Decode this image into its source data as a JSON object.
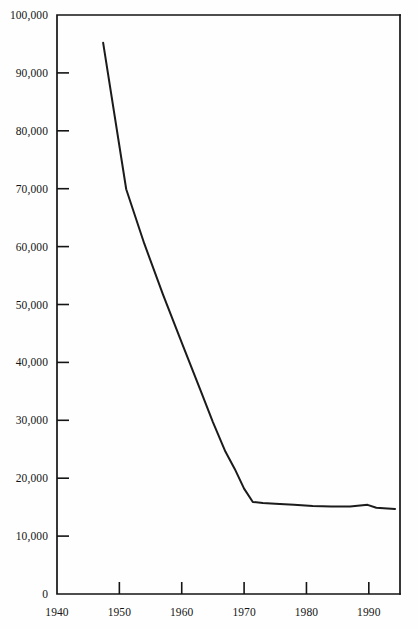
{
  "chart_data": {
    "type": "line",
    "title": "",
    "subtitle": "",
    "xlabel": "",
    "ylabel": "",
    "xlim": [
      1940,
      1995
    ],
    "ylim": [
      0,
      100000
    ],
    "grid": false,
    "legend": null,
    "x_ticks": [
      1940,
      1950,
      1960,
      1970,
      1980,
      1990
    ],
    "x_tick_labels": [
      "1940",
      "1950",
      "1960",
      "1970",
      "1980",
      "1990"
    ],
    "y_ticks": [
      0,
      10000,
      20000,
      30000,
      40000,
      50000,
      60000,
      70000,
      80000,
      90000,
      100000
    ],
    "y_tick_labels": [
      "0",
      "10,000",
      "20,000",
      "30,000",
      "40,000",
      "50,000",
      "60,000",
      "70,000",
      "80,000",
      "90,000",
      "100,000"
    ],
    "series": [
      {
        "name": "series-1",
        "color": "#1b1b1b",
        "x": [
          1947.4,
          1951.1,
          1954,
          1957,
          1960,
          1963,
          1965,
          1967,
          1968.5,
          1970,
          1971.4,
          1973,
          1975,
          1978,
          1981,
          1984,
          1987,
          1989.8,
          1991.2,
          1994.2
        ],
        "values": [
          95200,
          69900,
          60500,
          51700,
          43400,
          35200,
          29700,
          24600,
          21600,
          18200,
          15900,
          15700,
          15600,
          15400,
          15200,
          15100,
          15100,
          15400,
          14900,
          14700
        ]
      }
    ]
  },
  "axes": {
    "frame_color": "#141414",
    "background_color": "#fefefe"
  }
}
